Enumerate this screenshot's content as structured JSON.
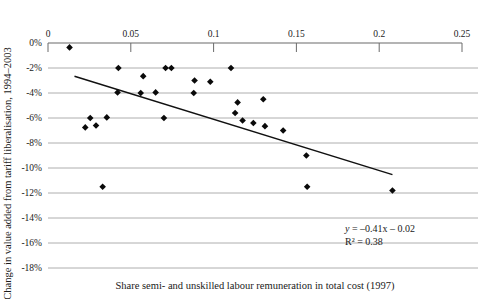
{
  "chart_data": {
    "type": "scatter",
    "title": "",
    "xlabel": "Share semi- and unskilled labour remuneration in total cost (1997)",
    "ylabel": "Change in value added from tariff liberalisation, 1994–2003",
    "xlim": [
      0,
      0.25
    ],
    "ylim": [
      -0.18,
      0.0
    ],
    "xticks": [
      0,
      0.05,
      0.1,
      0.15,
      0.2,
      0.25
    ],
    "xtick_labels": [
      "0",
      "0.05",
      "0.1",
      "0.15",
      "0.2",
      "0.25"
    ],
    "yticks": [
      0,
      -0.02,
      -0.04,
      -0.06,
      -0.08,
      -0.1,
      -0.12,
      -0.14,
      -0.16,
      -0.18
    ],
    "ytick_labels": [
      "0%",
      "-2%",
      "-4%",
      "-6%",
      "-8%",
      "-10%",
      "-12%",
      "-14%",
      "-16%",
      "-18%"
    ],
    "grid": true,
    "grid_axis": "y",
    "xaxis_position": "top",
    "legend": false,
    "marker_style": "diamond",
    "marker_color": "#0a0a0a",
    "points": [
      {
        "x": 0.013,
        "y": -0.0035
      },
      {
        "x": 0.0425,
        "y": -0.02
      },
      {
        "x": 0.042,
        "y": -0.0395
      },
      {
        "x": 0.0355,
        "y": -0.0595
      },
      {
        "x": 0.0255,
        "y": -0.06
      },
      {
        "x": 0.029,
        "y": -0.066
      },
      {
        "x": 0.0225,
        "y": -0.0675
      },
      {
        "x": 0.033,
        "y": -0.115
      },
      {
        "x": 0.0575,
        "y": -0.0265
      },
      {
        "x": 0.056,
        "y": -0.04
      },
      {
        "x": 0.065,
        "y": -0.0395
      },
      {
        "x": 0.07,
        "y": -0.06
      },
      {
        "x": 0.071,
        "y": -0.02
      },
      {
        "x": 0.0745,
        "y": -0.02
      },
      {
        "x": 0.0885,
        "y": -0.03
      },
      {
        "x": 0.098,
        "y": -0.031
      },
      {
        "x": 0.088,
        "y": -0.04
      },
      {
        "x": 0.1105,
        "y": -0.02
      },
      {
        "x": 0.1145,
        "y": -0.0475
      },
      {
        "x": 0.113,
        "y": -0.056
      },
      {
        "x": 0.1175,
        "y": -0.062
      },
      {
        "x": 0.124,
        "y": -0.064
      },
      {
        "x": 0.13,
        "y": -0.045
      },
      {
        "x": 0.131,
        "y": -0.0665
      },
      {
        "x": 0.142,
        "y": -0.07
      },
      {
        "x": 0.156,
        "y": -0.09
      },
      {
        "x": 0.1565,
        "y": -0.115
      },
      {
        "x": 0.208,
        "y": -0.118
      }
    ],
    "trendline": {
      "equation": "y = –0.41x – 0.02",
      "r2_label": "R² = 0.38",
      "slope": -0.41,
      "intercept": -0.02,
      "r2": 0.38,
      "x_start": 0.016,
      "x_end": 0.208
    }
  },
  "annotations": {
    "equation_line1": "y = –0.41x – 0.02",
    "equation_line2": "R² = 0.38"
  }
}
